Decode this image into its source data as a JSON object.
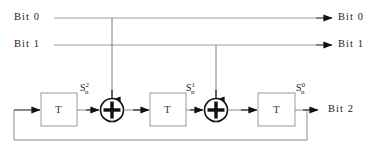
{
  "figure": {
    "kind": "lfsr-shift-register-diagram",
    "width": 385,
    "height": 149,
    "background": "#ffffff",
    "line_color": "#8a8a8a",
    "arrow_color": "#101010",
    "text_color": "#1c1c1c",
    "box_border_color": "#9a9a9a"
  },
  "inputs": [
    {
      "name": "bit0-input",
      "label": "Bit 0"
    },
    {
      "name": "bit1-input",
      "label": "Bit 1"
    }
  ],
  "outputs": [
    {
      "name": "bit0-output",
      "label": "Bit 0"
    },
    {
      "name": "bit1-output",
      "label": "Bit 1"
    },
    {
      "name": "bit2-output",
      "label": "Bit 2"
    }
  ],
  "registers": [
    {
      "name": "delay-register-1",
      "label": "T"
    },
    {
      "name": "delay-register-2",
      "label": "T"
    },
    {
      "name": "delay-register-3",
      "label": "T"
    }
  ],
  "adders": [
    {
      "name": "xor-adder-1",
      "glyph": "+"
    },
    {
      "name": "xor-adder-2",
      "glyph": "+"
    }
  ],
  "state_labels": [
    {
      "name": "state-s-n-2",
      "base": "S",
      "sub": "n",
      "sup": "2"
    },
    {
      "name": "state-s-n-1",
      "base": "S",
      "sub": "n",
      "sup": "1"
    },
    {
      "name": "state-s-n-0",
      "base": "S",
      "sub": "n",
      "sup": "0"
    }
  ]
}
